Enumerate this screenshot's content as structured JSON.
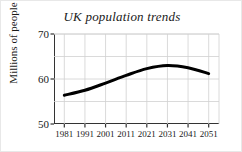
{
  "chart_data": {
    "type": "line",
    "title": "UK population trends",
    "xlabel": "",
    "ylabel": "Millions of people",
    "x": [
      1981,
      1991,
      2001,
      2011,
      2021,
      2031,
      2041,
      2051
    ],
    "xtick_labels": [
      "1981",
      "1991",
      "2001",
      "2011",
      "2021",
      "2031",
      "2041",
      "2051"
    ],
    "values": [
      56.4,
      57.5,
      59.1,
      60.8,
      62.3,
      63.0,
      62.5,
      61.2
    ],
    "series": [
      {
        "name": "UK population",
        "values": [
          56.4,
          57.5,
          59.1,
          60.8,
          62.3,
          63.0,
          62.5,
          61.2
        ]
      }
    ],
    "xlim": [
      1976,
      2056
    ],
    "ylim": [
      50,
      70
    ],
    "ytick_labels": [
      "50",
      "60",
      "70"
    ],
    "yticks": [
      50,
      60,
      70
    ],
    "y_gridlines": [
      55,
      60,
      65,
      70
    ],
    "grid": true,
    "grid_color": "#d0d0d0",
    "line_color": "#000000",
    "line_width": 3,
    "legend": false,
    "legend_position": "none",
    "axis_color": "#333333",
    "background": "#ffffff"
  }
}
